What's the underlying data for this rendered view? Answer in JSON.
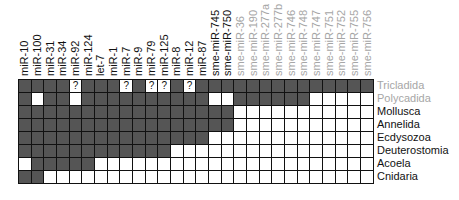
{
  "chart_data": {
    "type": "heatmap",
    "title": "",
    "columns": [
      "miR-10",
      "miR-100",
      "miR-31",
      "miR-34",
      "miR-92",
      "miR-124",
      "let-7",
      "miR-1",
      "miR-7",
      "miR-9",
      "miR-79",
      "miR-125",
      "miR-8",
      "miR-12",
      "miR-87",
      "sme-miR-745",
      "sme-miR-750",
      "sme-miR-36",
      "sme-miR-190",
      "sme-miR-277a",
      "sme-miR-277b",
      "sme-miR-746",
      "sme-miR-748",
      "sme-miR-747",
      "sme-miR-751",
      "sme-miR-752",
      "sme-miR-755",
      "sme-miR-756"
    ],
    "grey_columns_from_index": 17,
    "rows": [
      "Tricladida",
      "Polycadida",
      "Mollusca",
      "Annelida",
      "Ecdysozoa",
      "Deuterostomia",
      "Acoela",
      "Cnidaria"
    ],
    "grey_rows": [
      "Tricladida",
      "Polycadida"
    ],
    "legend": {
      "1": "present (dark)",
      "0": "absent (white)",
      "?": "uncertain"
    },
    "matrix": [
      [
        "1",
        "1",
        "1",
        "1",
        "?",
        "1",
        "1",
        "1",
        "?",
        "1",
        "?",
        "?",
        "1",
        "?",
        "1",
        "1",
        "1",
        "1",
        "1",
        "1",
        "1",
        "1",
        "1",
        "1",
        "1",
        "1",
        "1",
        "1"
      ],
      [
        "1",
        "0",
        "1",
        "1",
        "0",
        "1",
        "1",
        "1",
        "1",
        "1",
        "1",
        "1",
        "1",
        "1",
        "1",
        "0",
        "0",
        "1",
        "1",
        "1",
        "1",
        "1",
        "1",
        "0",
        "0",
        "0",
        "0",
        "0"
      ],
      [
        "1",
        "1",
        "1",
        "1",
        "1",
        "1",
        "1",
        "1",
        "1",
        "1",
        "1",
        "1",
        "1",
        "1",
        "1",
        "1",
        "1",
        "0",
        "0",
        "0",
        "0",
        "0",
        "0",
        "0",
        "0",
        "0",
        "0",
        "0"
      ],
      [
        "1",
        "1",
        "1",
        "1",
        "1",
        "1",
        "1",
        "1",
        "1",
        "1",
        "1",
        "1",
        "1",
        "1",
        "1",
        "1",
        "1",
        "0",
        "0",
        "0",
        "0",
        "0",
        "0",
        "0",
        "0",
        "0",
        "0",
        "0"
      ],
      [
        "1",
        "1",
        "1",
        "1",
        "1",
        "1",
        "1",
        "1",
        "1",
        "1",
        "1",
        "1",
        "1",
        "1",
        "1",
        "0",
        "0",
        "0",
        "0",
        "0",
        "0",
        "0",
        "0",
        "0",
        "0",
        "0",
        "0",
        "0"
      ],
      [
        "1",
        "1",
        "1",
        "1",
        "1",
        "1",
        "1",
        "1",
        "1",
        "1",
        "1",
        "1",
        "0",
        "0",
        "0",
        "0",
        "0",
        "0",
        "0",
        "0",
        "0",
        "0",
        "0",
        "0",
        "0",
        "0",
        "0",
        "0"
      ],
      [
        "0",
        "1",
        "1",
        "1",
        "1",
        "1",
        "0",
        "0",
        "0",
        "0",
        "0",
        "0",
        "0",
        "0",
        "0",
        "0",
        "0",
        "0",
        "0",
        "0",
        "0",
        "0",
        "0",
        "0",
        "0",
        "0",
        "0",
        "0"
      ],
      [
        "1",
        "1",
        "0",
        "0",
        "0",
        "0",
        "0",
        "0",
        "0",
        "0",
        "0",
        "0",
        "0",
        "0",
        "0",
        "0",
        "0",
        "0",
        "0",
        "0",
        "0",
        "0",
        "0",
        "0",
        "0",
        "0",
        "0",
        "0"
      ]
    ],
    "colors": {
      "present": "#555555",
      "absent": "#ffffff",
      "grid": "#111111",
      "grey_label": "#a6a6a6",
      "label": "#111111"
    }
  }
}
